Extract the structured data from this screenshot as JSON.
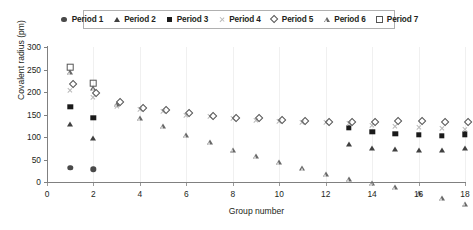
{
  "chart_data": {
    "type": "scatter",
    "title": "",
    "xlabel": "Group number",
    "ylabel": "Covalent radius (pm)",
    "xlim": [
      0,
      18
    ],
    "ylim": [
      0,
      300
    ],
    "xticks": [
      0,
      2,
      4,
      6,
      8,
      10,
      12,
      14,
      16,
      18
    ],
    "yticks": [
      0,
      50,
      100,
      150,
      200,
      250,
      300
    ],
    "grid": "vertical-light",
    "legend_position": "top-center",
    "series": [
      {
        "name": "Period 1",
        "marker": "filled-circle",
        "color": "#4a4a4a",
        "x": [
          1,
          2
        ],
        "y": [
          32,
          28
        ]
      },
      {
        "name": "Period 2",
        "marker": "filled-triangle",
        "color": "#404040",
        "x": [
          1,
          2,
          13,
          14,
          15,
          16,
          17,
          18
        ],
        "y": [
          130,
          97,
          84,
          76,
          73,
          71,
          72,
          75
        ]
      },
      {
        "name": "Period 3",
        "marker": "filled-square",
        "color": "#1a1a1a",
        "x": [
          1,
          2,
          13,
          14,
          15,
          16,
          17,
          18
        ],
        "y": [
          167,
          142,
          120,
          111,
          107,
          105,
          102,
          106
        ]
      },
      {
        "name": "Period 4",
        "marker": "cross-x",
        "color": "#b9b9b9",
        "x": [
          1,
          2,
          3,
          4,
          5,
          6,
          7,
          8,
          9,
          10,
          11,
          12,
          13,
          14,
          15,
          16,
          17,
          18
        ],
        "y": [
          205,
          190,
          170,
          162,
          158,
          150,
          146,
          142,
          139,
          136,
          134,
          133,
          131,
          127,
          124,
          122,
          120,
          118
        ]
      },
      {
        "name": "Period 5",
        "marker": "open-diamond",
        "color": "#555555",
        "x": [
          1,
          2,
          3,
          4,
          5,
          6,
          7,
          8,
          9,
          10,
          11,
          12,
          13,
          14,
          15,
          16,
          17,
          18
        ],
        "y": [
          225,
          205,
          185,
          172,
          166,
          160,
          154,
          150,
          148,
          145,
          142,
          140,
          139,
          141,
          143,
          142,
          141,
          140
        ]
      },
      {
        "name": "Period 6",
        "marker": "open-triangle",
        "color": "#676767",
        "x": [
          1,
          2,
          3,
          4,
          5,
          6,
          7,
          8,
          9,
          10,
          11,
          12,
          13,
          14,
          15,
          16,
          17,
          18
        ],
        "y": [
          245,
          220,
          195,
          175,
          168,
          160,
          155,
          150,
          147,
          144,
          142,
          140,
          140,
          142,
          144,
          143,
          142,
          141
        ]
      },
      {
        "name": "Period 7",
        "marker": "open-square",
        "color": "#555555",
        "x": [
          1,
          2
        ],
        "y": [
          255,
          220
        ]
      }
    ]
  },
  "legend": {
    "items": [
      {
        "label": "Period 1",
        "marker": "filled-circle-icon"
      },
      {
        "label": "Period 2",
        "marker": "filled-triangle-icon"
      },
      {
        "label": "Period 3",
        "marker": "filled-square-icon"
      },
      {
        "label": "Period 4",
        "marker": "cross-x-icon"
      },
      {
        "label": "Period 5",
        "marker": "open-diamond-icon"
      },
      {
        "label": "Period 6",
        "marker": "open-triangle-icon"
      },
      {
        "label": "Period 7",
        "marker": "open-square-icon"
      }
    ]
  }
}
